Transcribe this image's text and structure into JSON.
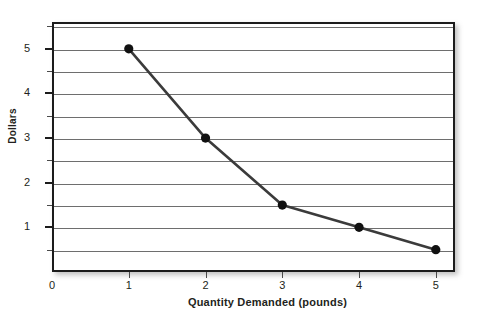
{
  "chart_data": {
    "type": "line",
    "title": "",
    "xlabel": "Quantity Demanded (pounds)",
    "ylabel": "Dollars",
    "x": [
      1,
      2,
      3,
      4,
      5
    ],
    "values": [
      5,
      3,
      1.5,
      1,
      0.5
    ],
    "series": [
      {
        "name": "Demand",
        "x": [
          1,
          2,
          3,
          4,
          5
        ],
        "values": [
          5,
          3,
          1.5,
          1,
          0.5
        ]
      }
    ],
    "xlim": [
      0,
      5.25
    ],
    "ylim": [
      0,
      5.6
    ],
    "xticks": [
      0,
      1,
      2,
      3,
      4,
      5
    ],
    "xtick_labels": [
      "0",
      "1",
      "2",
      "3",
      "4",
      "5"
    ],
    "yticks": [
      1,
      2,
      3,
      4,
      5
    ],
    "ytick_labels": [
      "1",
      "2",
      "3",
      "4",
      "5"
    ],
    "y_minor_ticks": [
      0.5,
      1.5,
      2.5,
      3.5,
      4.5,
      5.5
    ],
    "gridlines": [
      0.5,
      1,
      1.5,
      2,
      2.5,
      3,
      3.5,
      4,
      4.5,
      5,
      5.5
    ],
    "grid": true,
    "legend": "none",
    "marker": "circle",
    "line_color": "#3b3b3b",
    "marker_color": "#111111",
    "grid_color": "#6e6e6e",
    "frame_color": "#1c1c1c",
    "background": "#ffffff"
  },
  "axes": {
    "y_origin_label": "0"
  }
}
